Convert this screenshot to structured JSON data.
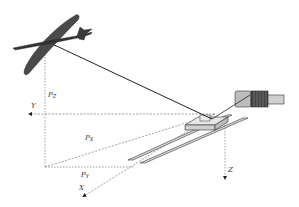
{
  "diagram": {
    "labels": {
      "pz": "P",
      "pz_sub": "Z",
      "px": "P",
      "px_sub": "X",
      "py": "P",
      "py_sub": "Y",
      "axis_x": "X",
      "axis_y": "Y",
      "axis_z": "Z"
    },
    "components": [
      "aircraft",
      "tether",
      "carriage",
      "rails",
      "winch"
    ],
    "colors": {
      "aircraft": "#555555",
      "line": "#222222",
      "dashed": "#777777",
      "rail_fill": "#d8d8d8",
      "winch_fill": "#bdbdbd",
      "winch_coil": "#444444"
    }
  }
}
